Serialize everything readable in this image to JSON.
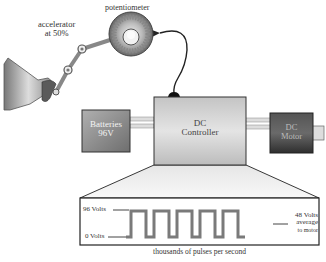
{
  "labels": {
    "potentiometer": "potentiometer",
    "accelerator_line1": "accelerator",
    "accelerator_line2": "at 50%",
    "batteries_line1": "Batteries",
    "batteries_line2": "96V",
    "controller_line1": "DC",
    "controller_line2": "Controller",
    "motor_line1": "DC",
    "motor_line2": "Motor"
  },
  "waveform": {
    "high_label": "96 Volts",
    "low_label": "0 Volts",
    "avg_line1": "48 Volts",
    "avg_line2": "average",
    "avg_line3": "to motor",
    "caption": "thousands of pulses per second",
    "pulse_count": 5,
    "duty_cycle_percent": 50
  },
  "colors": {
    "battery": "#8a8a8a",
    "controller": "#c8c8c8",
    "motor": "#3a3a3a",
    "wave": "#777777",
    "outline": "#222222"
  }
}
